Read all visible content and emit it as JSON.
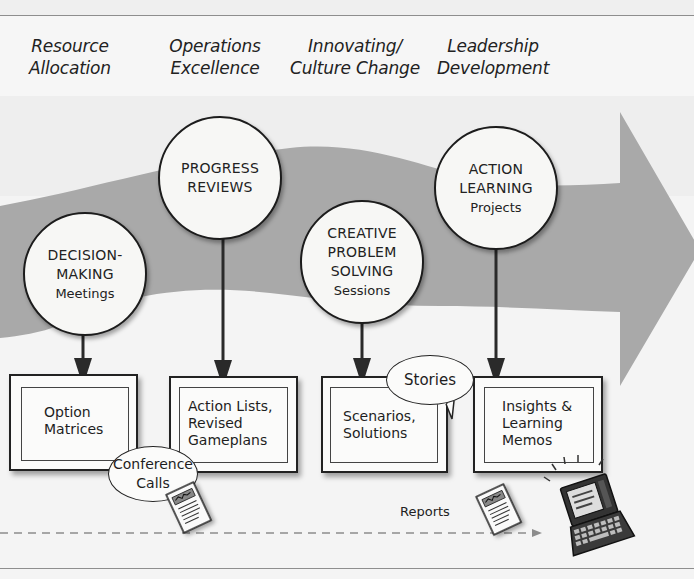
{
  "colors": {
    "background": "#f4f4f4",
    "band_light": "#ececec",
    "arrow_gray": "#a9a9a9",
    "outline": "#1c1c1c",
    "rule": "#8e8e8e"
  },
  "stages": [
    {
      "line1": "Resource",
      "line2": "Allocation"
    },
    {
      "line1": "Operations",
      "line2": "Excellence"
    },
    {
      "line1": "Innovating/",
      "line2": "Culture Change"
    },
    {
      "line1": "Leadership",
      "line2": "Development"
    }
  ],
  "circles": [
    {
      "title1": "DECISION-",
      "title2": "MAKING",
      "sub": "Meetings"
    },
    {
      "title1": "PROGRESS",
      "title2": "REVIEWS",
      "sub": ""
    },
    {
      "title1": "CREATIVE",
      "title2": "PROBLEM",
      "title3": "SOLVING",
      "sub": "Sessions"
    },
    {
      "title1": "ACTION",
      "title2": "LEARNING",
      "sub": "Projects"
    }
  ],
  "outputs": [
    {
      "line1": "Option",
      "line2": "Matrices",
      "line3": ""
    },
    {
      "line1": "Action Lists,",
      "line2": "Revised",
      "line3": "Gameplans"
    },
    {
      "line1": "Scenarios,",
      "line2": "Solutions",
      "line3": ""
    },
    {
      "line1": "Insights &",
      "line2": "Learning",
      "line3": "Memos"
    }
  ],
  "bubbles": {
    "conference": {
      "line1": "Conference",
      "line2": "Calls"
    },
    "stories": {
      "line1": "Stories"
    }
  },
  "flow": {
    "reports_label": "Reports"
  },
  "icons": [
    "document-icon",
    "document-icon",
    "laptop-icon",
    "big-flow-arrow"
  ]
}
